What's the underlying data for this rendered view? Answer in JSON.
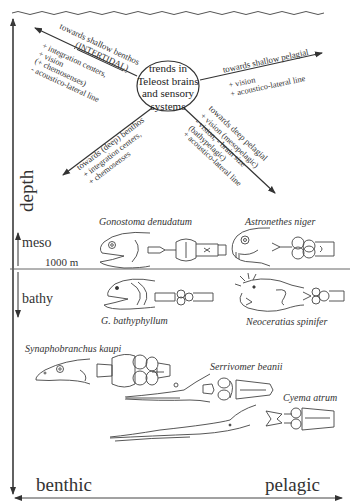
{
  "diagram": {
    "center": {
      "lines": [
        "trends in",
        "Teleost brains",
        "and sensory",
        "systems"
      ]
    },
    "branches": {
      "shallow_benthos": {
        "title": "towards shallow benthos",
        "subtitle": "(INTERTIDAL)",
        "traits": [
          "+ integration centers,",
          "+ vision",
          "(+ chemosenses)",
          "- acoustico-lateral line"
        ]
      },
      "shallow_pelagial": {
        "title": "towards shallow pelagial",
        "traits": [
          "+ vision",
          "+ acoustico-lateral line"
        ]
      },
      "deep_benthos": {
        "title": "towards (deep) benthos",
        "traits": [
          "+ integration centers,",
          "+ chemosenses"
        ]
      },
      "deep_pelagial": {
        "title": "towards deep pelagial",
        "traits": [
          "+ vision (mesopelagic)",
          "- vision, - brain size",
          "(bathypelagic)",
          "+ acoustico-lateral line"
        ]
      }
    },
    "axes": {
      "vertical_label": "depth",
      "horizontal_left": "benthic",
      "horizontal_right": "pelagic",
      "zone_upper": "meso",
      "zone_lower": "bathy",
      "boundary_label": "1000 m"
    },
    "species": [
      {
        "name": "Gonostoma denudatum",
        "zone": "meso",
        "habitat": "benthic side"
      },
      {
        "name": "Astronethes niger",
        "zone": "meso",
        "habitat": "pelagic side"
      },
      {
        "name": "G. bathyphyllum",
        "zone": "bathy",
        "habitat": "benthic side"
      },
      {
        "name": "Neoceratias spinifer",
        "zone": "bathy",
        "habitat": "pelagic side"
      },
      {
        "name": "Synaphobranchus kaupi",
        "zone": "deep",
        "habitat": "benthic"
      },
      {
        "name": "Serrivomer beanii",
        "zone": "deep",
        "habitat": "intermediate"
      },
      {
        "name": "Cyema atrum",
        "zone": "deep",
        "habitat": "pelagic"
      }
    ],
    "colors": {
      "ink": "#333333",
      "background": "#ffffff"
    }
  }
}
